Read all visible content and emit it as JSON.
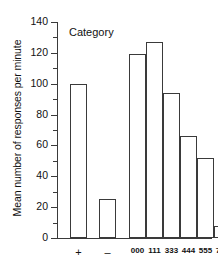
{
  "chart_data": {
    "type": "bar",
    "title": "",
    "annotation": "Category",
    "xlabel": "",
    "ylabel": "Mean number of responses per minute",
    "ylim": [
      0,
      140
    ],
    "ytick_labels": [
      "0",
      "20",
      "40",
      "60",
      "80",
      "100",
      "120",
      "140"
    ],
    "ytick_values": [
      0,
      20,
      40,
      60,
      80,
      100,
      120,
      140
    ],
    "minor_tick_step": 10,
    "grid": false,
    "legend": "none",
    "categories": [
      "+",
      "–",
      "000",
      "111",
      "333",
      "444",
      "555",
      "777"
    ],
    "values": [
      100,
      25,
      119,
      127,
      94,
      66,
      52,
      8
    ],
    "bars": [
      {
        "label": "+",
        "value": 100,
        "group": "sign"
      },
      {
        "label": "–",
        "value": 25,
        "group": "sign"
      },
      {
        "label": "000",
        "value": 119,
        "group": "series"
      },
      {
        "label": "111",
        "value": 127,
        "group": "series"
      },
      {
        "label": "333",
        "value": 94,
        "group": "series"
      },
      {
        "label": "444",
        "value": 66,
        "group": "series"
      },
      {
        "label": "555",
        "value": 52,
        "group": "series"
      },
      {
        "label": "777",
        "value": 8,
        "group": "series"
      }
    ],
    "colors": {
      "bar_fill": "#ffffff",
      "bar_stroke": "#3a3a3a",
      "axis": "#3a3a3a",
      "text": "#111111",
      "background": "#ffffff"
    }
  }
}
